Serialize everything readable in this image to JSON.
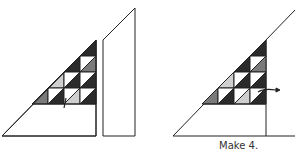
{
  "caption": "Make 4.",
  "colors": {
    "dark": "#2b2b2b",
    "medium": "#7a7a7a",
    "light": "#cfcfcf",
    "white": "#ffffff",
    "line": "#222222"
  },
  "figures": [
    {
      "name": "left-assembly",
      "description": "Triangle block with pieced half-square triangles, separate side strip"
    },
    {
      "name": "right-assembly",
      "description": "Joined triangle unit with pieced triangles and seam line"
    }
  ]
}
